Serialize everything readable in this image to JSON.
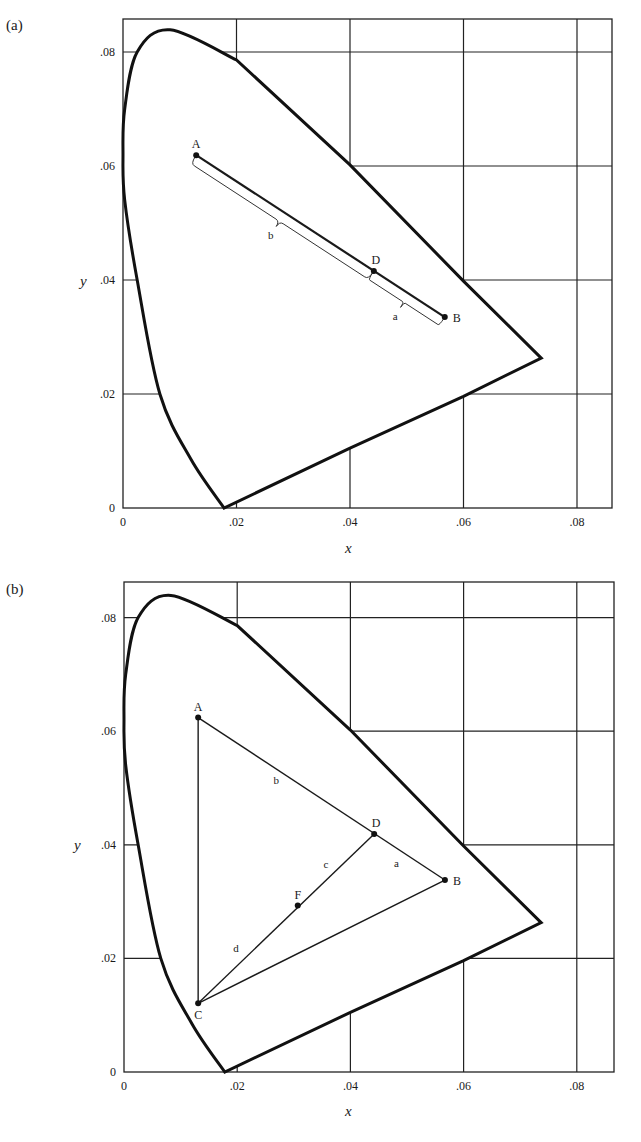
{
  "figure": {
    "panels": [
      "(a)",
      "(b)"
    ]
  },
  "chart_data": [
    {
      "type": "line",
      "panel": "(a)",
      "title": "",
      "xlabel": "x",
      "ylabel": "y",
      "xlim": [
        0,
        0.086
      ],
      "ylim": [
        0,
        0.086
      ],
      "grid": true,
      "x_ticks": [
        0,
        0.02,
        0.04,
        0.06,
        0.08
      ],
      "x_tick_labels": [
        "0",
        ".02",
        ".04",
        ".06",
        ".08"
      ],
      "y_ticks": [
        0,
        0.02,
        0.04,
        0.06,
        0.08
      ],
      "y_tick_labels": [
        "0",
        ".02",
        ".04",
        ".06",
        ".08"
      ],
      "locus": {
        "name": "spectral locus (boundary)",
        "points": [
          [
            0.0178,
            0
          ],
          [
            0.012,
            0.0085
          ],
          [
            0.0065,
            0.02
          ],
          [
            0.0025,
            0.04
          ],
          [
            0.0003,
            0.054
          ],
          [
            0.0,
            0.062
          ],
          [
            0.0003,
            0.07
          ],
          [
            0.0025,
            0.08
          ],
          [
            0.0083,
            0.0839
          ],
          [
            0.02,
            0.0786
          ],
          [
            0.04,
            0.0602
          ],
          [
            0.06,
            0.0398
          ],
          [
            0.0737,
            0.0263
          ],
          [
            0.06,
            0.0196
          ],
          [
            0.04,
            0.0105
          ],
          [
            0.0178,
            0
          ]
        ]
      },
      "points": [
        {
          "label": "A",
          "x": 0.0129,
          "y": 0.0619
        },
        {
          "label": "D",
          "x": 0.0442,
          "y": 0.0416
        },
        {
          "label": "B",
          "x": 0.0567,
          "y": 0.0335
        }
      ],
      "segments": [
        {
          "from": "A",
          "to": "B"
        }
      ],
      "braces": [
        {
          "from": "A",
          "to": "D",
          "label": "b"
        },
        {
          "from": "D",
          "to": "B",
          "label": "a"
        }
      ]
    },
    {
      "type": "line",
      "panel": "(b)",
      "title": "",
      "xlabel": "x",
      "ylabel": "y",
      "xlim": [
        0,
        0.086
      ],
      "ylim": [
        0,
        0.086
      ],
      "grid": true,
      "x_ticks": [
        0,
        0.02,
        0.04,
        0.06,
        0.08
      ],
      "x_tick_labels": [
        "0",
        ".02",
        ".04",
        ".06",
        ".08"
      ],
      "y_ticks": [
        0,
        0.02,
        0.04,
        0.06,
        0.08
      ],
      "y_tick_labels": [
        "0",
        ".02",
        ".04",
        ".06",
        ".08"
      ],
      "locus": {
        "name": "spectral locus (boundary)",
        "points": [
          [
            0.0178,
            0
          ],
          [
            0.012,
            0.0085
          ],
          [
            0.0065,
            0.02
          ],
          [
            0.0025,
            0.04
          ],
          [
            0.0003,
            0.054
          ],
          [
            0.0,
            0.062
          ],
          [
            0.0003,
            0.07
          ],
          [
            0.0025,
            0.08
          ],
          [
            0.0083,
            0.0839
          ],
          [
            0.02,
            0.0786
          ],
          [
            0.04,
            0.0602
          ],
          [
            0.06,
            0.0398
          ],
          [
            0.0737,
            0.0263
          ],
          [
            0.06,
            0.0196
          ],
          [
            0.04,
            0.0105
          ],
          [
            0.0178,
            0
          ]
        ]
      },
      "points": [
        {
          "label": "A",
          "x": 0.0131,
          "y": 0.0624
        },
        {
          "label": "D",
          "x": 0.0442,
          "y": 0.0419
        },
        {
          "label": "B",
          "x": 0.0567,
          "y": 0.0338
        },
        {
          "label": "C",
          "x": 0.0131,
          "y": 0.0121
        },
        {
          "label": "F",
          "x": 0.0307,
          "y": 0.0293
        }
      ],
      "segments": [
        {
          "from": "A",
          "to": "B",
          "labels": [
            {
              "text": "b",
              "at": "A-D"
            },
            {
              "text": "a",
              "at": "D-B"
            }
          ]
        },
        {
          "from": "A",
          "to": "C"
        },
        {
          "from": "C",
          "to": "B"
        },
        {
          "from": "C",
          "to": "D",
          "labels": [
            {
              "text": "d",
              "at": "C-F"
            },
            {
              "text": "c",
              "at": "F-D"
            }
          ]
        }
      ]
    }
  ]
}
